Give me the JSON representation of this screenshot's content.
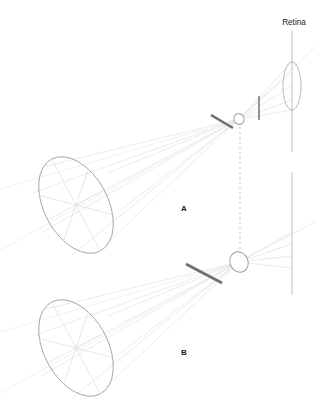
{
  "figure": {
    "title_visible": false,
    "width": 315,
    "height": 413,
    "background_color": "#ffffff"
  },
  "labels": {
    "retina": "Retina",
    "panel_a": "A",
    "panel_b": "B"
  },
  "colors": {
    "ray": "#d8d8d8",
    "ray_faint": "#e4e4e4",
    "object_outline": "#9a9a9a",
    "object_spoke": "#dcdcdc",
    "axis_line": "#c6c6c6",
    "pupil_outline": "#9a9a9a",
    "aperture_bar": "#6f6f6f",
    "dashed_guide": "#b4b4b4",
    "text": "#1a1a1a"
  },
  "panels": [
    {
      "id": "A",
      "label": "A",
      "label_x": 184,
      "label_y": 211,
      "object": {
        "name": "object-ellipse-a",
        "cx": 76,
        "cy": 205,
        "rx": 32,
        "ry": 52,
        "rotation_deg": -28,
        "spokes": 6
      },
      "pupil": {
        "name": "pupil-a",
        "cx": 239,
        "cy": 119,
        "rx": 5,
        "ry": 5.5,
        "rotation_deg": -25,
        "size_class": "small"
      },
      "aperture_bar": {
        "name": "aperture-bar-a",
        "x1": 211,
        "y1": 115,
        "x2": 233,
        "y2": 128,
        "thickness": 2.6
      },
      "marker_bar": {
        "name": "image-marker-bar-a",
        "x1": 259,
        "y1": 96,
        "x2": 259,
        "y2": 120,
        "thickness": 1.8
      },
      "retina_plane": {
        "name": "retina-plane-a",
        "x": 292,
        "y1": 30,
        "y2": 152
      },
      "retina_ellipse": {
        "name": "retina-image-ellipse-a",
        "cx": 292,
        "cy": 86,
        "rx": 9,
        "ry": 24
      }
    },
    {
      "id": "B",
      "label": "B",
      "label_x": 184,
      "label_y": 355,
      "object": {
        "name": "object-ellipse-b",
        "cx": 76,
        "cy": 348,
        "rx": 32,
        "ry": 52,
        "rotation_deg": -28,
        "spokes": 6
      },
      "pupil": {
        "name": "pupil-b",
        "cx": 239,
        "cy": 262,
        "rx": 9,
        "ry": 10.5,
        "rotation_deg": -25,
        "size_class": "large"
      },
      "aperture_bar": {
        "name": "aperture-bar-b",
        "x1": 186,
        "y1": 264,
        "x2": 222,
        "y2": 283,
        "thickness": 2.8
      },
      "retina_plane": {
        "name": "retina-plane-b",
        "x": 292,
        "y1": 172,
        "y2": 295
      }
    }
  ],
  "guides": {
    "dashed_axis": {
      "name": "optical-axis-dashed",
      "x": 240,
      "y1": 127,
      "y2": 253,
      "dash": "2 3"
    },
    "retina_label_leader": {
      "name": "retina-label-leader",
      "x": 292,
      "y1": 30,
      "y2": 48
    }
  },
  "retina_label_position": {
    "x": 294,
    "y": 25,
    "anchor": "middle"
  }
}
